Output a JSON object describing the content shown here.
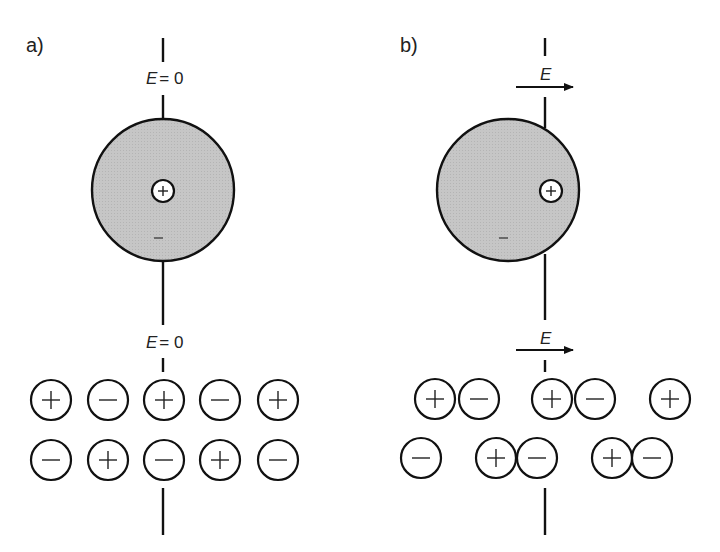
{
  "panels": [
    {
      "id": "a",
      "label": "a)",
      "top_field_label": "E = 0",
      "bottom_field_label": "E = 0",
      "field_symbol": "E",
      "field_value_text": "= 0",
      "atom": {
        "nucleus_sign": "+",
        "cloud_sign": "−",
        "polarized": false
      },
      "lattice_rows": [
        [
          "+",
          "−",
          "+",
          "−",
          "+"
        ],
        [
          "−",
          "+",
          "−",
          "+",
          "−"
        ]
      ]
    },
    {
      "id": "b",
      "label": "b)",
      "field_symbol": "E",
      "field_arrow_direction": "right",
      "atom": {
        "nucleus_sign": "+",
        "cloud_sign": "−",
        "polarized": true
      },
      "lattice_rows": [
        [
          "+",
          "−",
          "+",
          "−",
          "+"
        ],
        [
          "−",
          "+",
          "−",
          "+",
          "−"
        ]
      ],
      "lattice_pairing": "ions shifted into +/− dipole pairs"
    }
  ],
  "colors": {
    "cloud_fill": "#c4c4c4",
    "stroke": "#111111",
    "background": "#ffffff"
  }
}
